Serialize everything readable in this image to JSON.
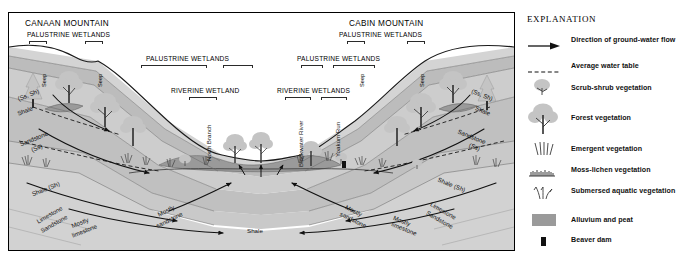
{
  "section": {
    "mountains": [
      {
        "name": "CANAAN MOUNTAIN"
      },
      {
        "name": "CABIN MOUNTAIN"
      }
    ],
    "wetland_labels": [
      {
        "text": "PALUSTRINE WETLANDS"
      },
      {
        "text": "PALUSTRINE WETLANDS"
      },
      {
        "text": "PALUSTRINE WETLANDS"
      },
      {
        "text": "PALUSTRINE WETLANDS"
      },
      {
        "text": "RIVERINE WETLAND"
      },
      {
        "text": "RIVERINE WETLANDS"
      }
    ],
    "seeps": [
      {
        "text": "Seep"
      },
      {
        "text": "Seep"
      },
      {
        "text": "Seep"
      },
      {
        "text": "Seep"
      }
    ],
    "streams": [
      {
        "text": "North Branch"
      },
      {
        "text": "Blackwater River"
      },
      {
        "text": "Yoakum Run"
      }
    ],
    "strata_left": [
      {
        "text": "(Ss, Sh)"
      },
      {
        "text": "Shale"
      },
      {
        "text": "Sandstone"
      },
      {
        "text": "(Ss)"
      },
      {
        "text": "Shale (Sh)"
      },
      {
        "text": "Limestone"
      },
      {
        "text": "Sandstone"
      },
      {
        "text": "Mostly"
      },
      {
        "text": "limestone"
      }
    ],
    "strata_right": [
      {
        "text": "(Ss, Sh)"
      },
      {
        "text": "Shale"
      },
      {
        "text": "Sandstone"
      },
      {
        "text": "(Ss)"
      },
      {
        "text": "Shale (Sh)"
      },
      {
        "text": "Limestone"
      },
      {
        "text": "Sandstone"
      },
      {
        "text": "Mostly"
      },
      {
        "text": "limestone"
      }
    ],
    "strata_center": [
      {
        "text": "Mostly"
      },
      {
        "text": "sandstone"
      },
      {
        "text": "Shale"
      },
      {
        "text": "Mostly"
      },
      {
        "text": "sandstone"
      }
    ]
  },
  "legend": {
    "title": "EXPLANATION",
    "items": [
      {
        "symbol": "arrow-right-icon",
        "label": "Direction of ground-water flow"
      },
      {
        "symbol": "dashed-line-icon",
        "label": "Average water table"
      },
      {
        "symbol": "shrub-icon",
        "label": "Scrub-shrub vegetation"
      },
      {
        "symbol": "tree-icon",
        "label": "Forest vegetation"
      },
      {
        "symbol": "emergent-grass-icon",
        "label": "Emergent vegetation"
      },
      {
        "symbol": "moss-lichen-icon",
        "label": "Moss-lichen vegetation"
      },
      {
        "symbol": "submersed-plant-icon",
        "label": "Submersed aquatic vegetation"
      },
      {
        "symbol": "gray-swatch-icon",
        "label": "Alluvium and peat"
      },
      {
        "symbol": "black-square-icon",
        "label": "Beaver dam"
      }
    ]
  },
  "colors": {
    "rock_light": "#d9d9d9",
    "rock_mid": "#c6c6c6",
    "rock_dark": "#b3b3b3",
    "alluvium": "#9a9a9a",
    "vegetation_gray": "#c4c4c4",
    "line": "#1a1a1a"
  }
}
